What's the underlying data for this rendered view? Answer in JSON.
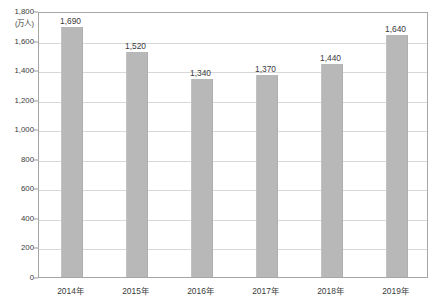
{
  "chart_data": {
    "type": "bar",
    "title": "",
    "subtitle": "",
    "xlabel": "",
    "ylabel": "",
    "unit_label": "(万人)",
    "categories": [
      "2014年",
      "2015年",
      "2016年",
      "2017年",
      "2018年",
      "2019年"
    ],
    "values": [
      1690,
      1520,
      1340,
      1370,
      1440,
      1640
    ],
    "data_labels": [
      "1,690",
      "1,520",
      "1,340",
      "1,370",
      "1,440",
      "1,640"
    ],
    "ylim": [
      0,
      1800
    ],
    "ytick_step": 200,
    "ytick_labels": [
      "1,800",
      "1,600",
      "1,400",
      "1,200",
      "1,000",
      "800",
      "600",
      "400",
      "200",
      "0"
    ],
    "ytick_values": [
      1800,
      1600,
      1400,
      1200,
      1000,
      800,
      600,
      400,
      200,
      0
    ],
    "grid": true,
    "legend": false,
    "series": [
      {
        "name": "",
        "values": [
          1690,
          1520,
          1340,
          1370,
          1440,
          1640
        ],
        "color": "#b8b8b8"
      }
    ],
    "colors": {
      "bar": "#b8b8b8",
      "gridline": "#d8d8d8",
      "frame": "#a6a6a6",
      "text": "#3b3b3b",
      "background": "#ffffff"
    }
  }
}
